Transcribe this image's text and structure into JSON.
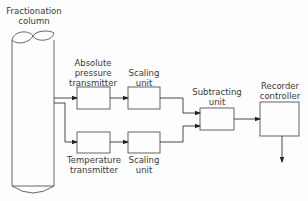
{
  "diagram": {
    "column": {
      "label_line1": "Fractionation",
      "label_line2": "column"
    },
    "blocks": [
      {
        "id": "pressure",
        "label_line1": "Absolute",
        "label_line2": "pressure",
        "label_line3": "transmitter"
      },
      {
        "id": "scaling_top",
        "label_line1": "Scaling",
        "label_line2": "unit"
      },
      {
        "id": "temperature",
        "label_line1": "Temperature",
        "label_line2": "transmitter"
      },
      {
        "id": "scaling_bottom",
        "label_line1": "Scaling",
        "label_line2": "unit"
      },
      {
        "id": "subtracting",
        "label_line1": "Subtracting",
        "label_line2": "unit"
      },
      {
        "id": "recorder",
        "label_line1": "Recorder",
        "label_line2": "controller"
      }
    ],
    "connections": [
      [
        "column",
        "pressure"
      ],
      [
        "column",
        "temperature"
      ],
      [
        "pressure",
        "scaling_top"
      ],
      [
        "temperature",
        "scaling_bottom"
      ],
      [
        "scaling_top",
        "subtracting"
      ],
      [
        "scaling_bottom",
        "subtracting"
      ],
      [
        "subtracting",
        "recorder"
      ],
      [
        "recorder",
        "output"
      ]
    ]
  }
}
